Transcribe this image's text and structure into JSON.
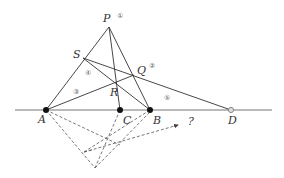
{
  "diagram": {
    "colors": {
      "line": "#333333",
      "base_line": "#777777",
      "dashed": "#555555",
      "point_fill": "#111111",
      "hollow_point": "#888888",
      "label": "#333333"
    },
    "points": {
      "P": {
        "label": "P",
        "marker": "①"
      },
      "Q": {
        "label": "Q",
        "marker": "②"
      },
      "R": {
        "label": "R"
      },
      "S": {
        "label": "S"
      },
      "A": {
        "label": "A"
      },
      "B": {
        "label": "B"
      },
      "C": {
        "label": "C"
      },
      "D": {
        "label": "D"
      }
    },
    "line_markers": {
      "line3": "③",
      "line4": "④",
      "line5": "⑤"
    },
    "arrow_label": "?"
  }
}
